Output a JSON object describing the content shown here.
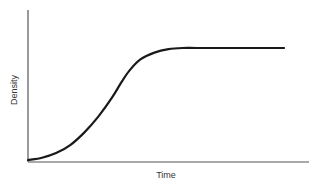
{
  "chart_data": {
    "type": "line",
    "title": "",
    "xlabel": "Time",
    "ylabel": "Density",
    "grid": false,
    "legend": null,
    "x_ticks": [],
    "y_ticks": [],
    "xlim": [
      0,
      1
    ],
    "ylim": [
      0,
      1
    ],
    "series": [
      {
        "name": "Sigmoid growth curve",
        "x": [
          0.0,
          0.05,
          0.1,
          0.15,
          0.2,
          0.25,
          0.3,
          0.33,
          0.36,
          0.4,
          0.45,
          0.5,
          0.55,
          0.6,
          0.7,
          0.8,
          0.9,
          0.91
        ],
        "y": [
          0.0,
          0.02,
          0.06,
          0.13,
          0.24,
          0.38,
          0.55,
          0.67,
          0.78,
          0.88,
          0.94,
          0.97,
          0.98,
          0.98,
          0.98,
          0.98,
          0.98,
          0.98
        ]
      }
    ],
    "annotations": []
  }
}
